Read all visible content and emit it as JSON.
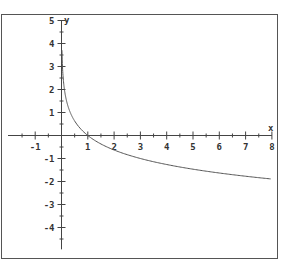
{
  "chart_data": {
    "type": "line",
    "title": "",
    "xlabel": "x",
    "ylabel": "y",
    "xlim": [
      -2,
      8
    ],
    "ylim": [
      -5,
      5
    ],
    "grid": false,
    "x_ticks": [
      -1,
      1,
      2,
      3,
      4,
      5,
      6,
      7,
      8
    ],
    "y_ticks": [
      5,
      4,
      3,
      2,
      1,
      -1,
      -2,
      -3,
      -4
    ],
    "minor_tick_step": 0.5,
    "series": [
      {
        "name": "y = -log3(x)",
        "function": "-log3(x)",
        "x": [
          0.017,
          0.05,
          0.1,
          0.25,
          0.5,
          1,
          2,
          3,
          4,
          5,
          6,
          7,
          8
        ],
        "values": [
          3.7,
          2.73,
          2.1,
          1.26,
          0.63,
          0,
          -0.63,
          -1,
          -1.26,
          -1.46,
          -1.63,
          -1.77,
          -1.89
        ],
        "color": "#555555"
      }
    ]
  },
  "colors": {
    "frame": "#555555",
    "axis": "#444444",
    "curve": "#555555",
    "background": "#ffffff"
  }
}
